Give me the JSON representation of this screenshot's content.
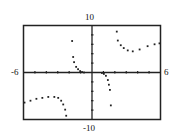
{
  "window": {
    "xmin_label": "-6",
    "xmax_label": "6",
    "ymax_label": "10",
    "ymin_label": "-10"
  },
  "chart_data": {
    "type": "scatter",
    "title": "",
    "xlabel": "",
    "ylabel": "",
    "xlim": [
      -6,
      6
    ],
    "ylim": [
      -10,
      10
    ],
    "x_tick_step": 1,
    "y_tick_step": 2,
    "grid": false,
    "legend": null,
    "series": [
      {
        "name": "branch-upper-left",
        "points": [
          [
            -1.74,
            6.7
          ],
          [
            -1.65,
            3.3
          ],
          [
            -1.57,
            2.2
          ],
          [
            -1.39,
            1.2
          ],
          [
            -1.22,
            0.7
          ],
          [
            -1.04,
            0.3
          ],
          [
            -0.87,
            0.1
          ],
          [
            -0.7,
            0.0
          ]
        ]
      },
      {
        "name": "branch-center",
        "points": [
          [
            0.87,
            -0.1
          ],
          [
            1.04,
            -0.3
          ],
          [
            1.22,
            -0.7
          ],
          [
            1.39,
            -1.6
          ],
          [
            1.48,
            -2.6
          ],
          [
            1.57,
            -3.7
          ],
          [
            1.65,
            -7.0
          ]
        ]
      },
      {
        "name": "branch-upper-right",
        "points": [
          [
            2.17,
            8.7
          ],
          [
            2.26,
            6.8
          ],
          [
            2.52,
            5.8
          ],
          [
            2.78,
            5.2
          ],
          [
            3.13,
            4.7
          ],
          [
            3.57,
            4.5
          ],
          [
            4.17,
            4.9
          ],
          [
            4.87,
            5.6
          ],
          [
            5.48,
            6.0
          ],
          [
            5.91,
            6.2
          ]
        ]
      },
      {
        "name": "branch-lower-left",
        "points": [
          [
            -5.91,
            -6.4
          ],
          [
            -5.39,
            -6.0
          ],
          [
            -4.87,
            -5.6
          ],
          [
            -4.35,
            -5.4
          ],
          [
            -3.83,
            -5.2
          ],
          [
            -3.3,
            -5.2
          ],
          [
            -2.96,
            -5.4
          ],
          [
            -2.7,
            -6.0
          ],
          [
            -2.52,
            -6.8
          ],
          [
            -2.35,
            -7.9
          ],
          [
            -2.26,
            -9.2
          ]
        ]
      }
    ]
  },
  "style": {
    "frame_color": "#222222",
    "point_color": "#222222"
  }
}
